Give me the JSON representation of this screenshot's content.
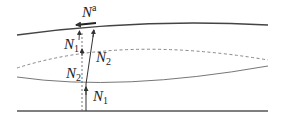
{
  "diagram": {
    "labels": {
      "n_a": {
        "base": "N",
        "sup": "a"
      },
      "n1_upper": {
        "base": "N",
        "sub": "1"
      },
      "n2_upper": {
        "base": "N",
        "sub": "2"
      },
      "n2_lower": {
        "base": "N",
        "sub": "2"
      },
      "n1_lower": {
        "base": "N",
        "sub": "1"
      }
    },
    "colors": {
      "thick_line": "#444444",
      "thin_line": "#777777",
      "dashed_line": "#888888",
      "arrow": "#333333"
    },
    "lines": [
      {
        "name": "upper-boundary",
        "style": "solid-thick"
      },
      {
        "name": "interface-dashed",
        "style": "dashed"
      },
      {
        "name": "interface-solid",
        "style": "solid-thin"
      },
      {
        "name": "lower-boundary",
        "style": "solid-thick"
      }
    ]
  }
}
